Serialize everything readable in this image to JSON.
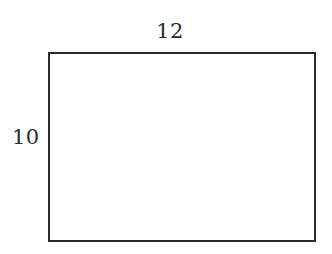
{
  "figure": {
    "type": "rectangle-diagram",
    "background_color": "#ffffff",
    "stroke_color": "#2a2a2a",
    "text_color": "#2a2a2a",
    "shape": {
      "name": "rectangle",
      "fill": "none"
    },
    "labels": {
      "top": "12",
      "left": "10"
    }
  }
}
